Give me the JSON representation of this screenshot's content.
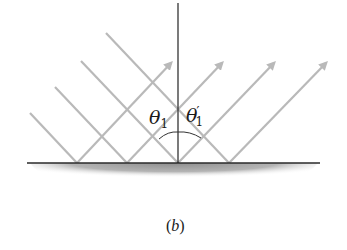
{
  "diagram": {
    "caption": "(b)",
    "caption_parts": {
      "open": "(",
      "letter": "b",
      "close": ")"
    },
    "labels": {
      "incident_angle": {
        "symbol": "θ",
        "subscript": "1",
        "prime": ""
      },
      "reflected_angle": {
        "symbol": "θ",
        "subscript": "1",
        "prime": "′"
      }
    },
    "colors": {
      "ray": "#b9b9b9",
      "normal": "#222222",
      "surface": "#2a2a2a",
      "surface_shade": "#9a9a9a"
    },
    "surface": {
      "x1": 27,
      "x2": 320,
      "y": 163
    },
    "normal": {
      "x": 178,
      "y_top": 3,
      "y_bottom": 163
    },
    "incident_rays": [
      {
        "start": [
          30,
          113
        ],
        "hit": [
          77,
          163
        ]
      },
      {
        "start": [
          55,
          87
        ],
        "hit": [
          127,
          163
        ]
      },
      {
        "start": [
          106,
          33
        ],
        "hit": [
          229,
          163
        ]
      },
      {
        "start": [
          81,
          61
        ],
        "hit": [
          178,
          163
        ]
      }
    ],
    "reflected_rays": [
      {
        "from": [
          77,
          163
        ],
        "tip": [
          171,
          63
        ]
      },
      {
        "from": [
          127,
          163
        ],
        "tip": [
          222,
          63
        ]
      },
      {
        "from": [
          178,
          163
        ],
        "tip": [
          274,
          63
        ]
      },
      {
        "from": [
          229,
          163
        ],
        "tip": [
          326,
          63
        ]
      }
    ]
  }
}
